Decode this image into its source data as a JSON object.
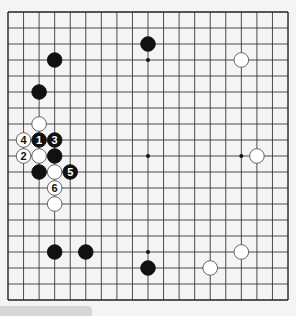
{
  "board": {
    "size": 19,
    "origin": [
      8,
      12
    ],
    "spacing": [
      15.556,
      16
    ],
    "line_color": "#222222",
    "background": "#f4f4f4",
    "star_points": [
      [
        9,
        3
      ],
      [
        9,
        9
      ],
      [
        15,
        9
      ],
      [
        9,
        15
      ],
      [
        3,
        9
      ]
    ],
    "stones": [
      {
        "color": "black",
        "col": 9,
        "row": 2
      },
      {
        "color": "black",
        "col": 3,
        "row": 3
      },
      {
        "color": "black",
        "col": 2,
        "row": 5
      },
      {
        "color": "white",
        "col": 15,
        "row": 3
      },
      {
        "color": "white",
        "col": 16,
        "row": 9
      },
      {
        "color": "white",
        "col": 2,
        "row": 7
      },
      {
        "color": "white",
        "col": 1,
        "row": 8,
        "label": "4"
      },
      {
        "color": "black",
        "col": 2,
        "row": 8,
        "label": "1"
      },
      {
        "color": "black",
        "col": 3,
        "row": 8,
        "label": "3"
      },
      {
        "color": "white",
        "col": 1,
        "row": 9,
        "label": "2"
      },
      {
        "color": "white",
        "col": 2,
        "row": 9
      },
      {
        "color": "black",
        "col": 3,
        "row": 9
      },
      {
        "color": "black",
        "col": 2,
        "row": 10
      },
      {
        "color": "white",
        "col": 3,
        "row": 10
      },
      {
        "color": "black",
        "col": 4,
        "row": 10,
        "label": "5"
      },
      {
        "color": "white",
        "col": 3,
        "row": 11,
        "label": "6"
      },
      {
        "color": "white",
        "col": 3,
        "row": 12
      },
      {
        "color": "black",
        "col": 3,
        "row": 15
      },
      {
        "color": "black",
        "col": 5,
        "row": 15
      },
      {
        "color": "black",
        "col": 9,
        "row": 16
      },
      {
        "color": "white",
        "col": 13,
        "row": 16
      },
      {
        "color": "white",
        "col": 15,
        "row": 15
      }
    ]
  },
  "footer_tab": {
    "text": ""
  }
}
